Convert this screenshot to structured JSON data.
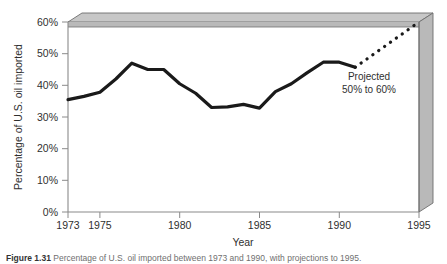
{
  "figure": {
    "caption_label": "Figure",
    "caption_number": "1.31",
    "caption_text": "Percentage of U.S. oil imported between 1973 and 1990, with projections to 1995."
  },
  "annotations": {
    "projection_line1": "Projected",
    "projection_line2": "50% to 60%"
  },
  "colors": {
    "line": "#1a1a1a",
    "wall_face": "#b9b9b9",
    "wall_top": "#cfcfcf",
    "wall_edge": "#6e6e6e",
    "axis": "#888888",
    "text": "#2f2f2f",
    "background": "#ffffff"
  },
  "chart_data": {
    "type": "line",
    "title": "",
    "xlabel": "Year",
    "ylabel": "Percentage of U.S. oil imported",
    "xlim": [
      1973,
      1995
    ],
    "ylim": [
      0,
      60
    ],
    "grid": false,
    "legend": "none",
    "x_tick_labels": [
      "1973",
      "1975",
      "1980",
      "1985",
      "1990",
      "1995"
    ],
    "x_ticks": [
      1973,
      1975,
      1980,
      1985,
      1990,
      1995
    ],
    "y_tick_labels": [
      "0%",
      "10%",
      "20%",
      "30%",
      "40%",
      "50%",
      "60%"
    ],
    "y_ticks": [
      0,
      10,
      20,
      30,
      40,
      50,
      60
    ],
    "series": [
      {
        "name": "Actual imported percentage",
        "style": "solid",
        "x": [
          1973,
          1974,
          1975,
          1976,
          1977,
          1978,
          1979,
          1980,
          1981,
          1982,
          1983,
          1984,
          1985,
          1986,
          1987,
          1988,
          1989,
          1990,
          1991
        ],
        "values": [
          35.5,
          36.5,
          37.8,
          42.0,
          47.0,
          45.0,
          45.0,
          40.5,
          37.5,
          33.0,
          33.2,
          34.0,
          32.8,
          38.0,
          40.5,
          44.0,
          47.3,
          47.3,
          45.7
        ]
      },
      {
        "name": "Projected imported percentage",
        "style": "dotted",
        "x": [
          1991,
          1995
        ],
        "values": [
          45.7,
          60.0
        ]
      }
    ]
  }
}
